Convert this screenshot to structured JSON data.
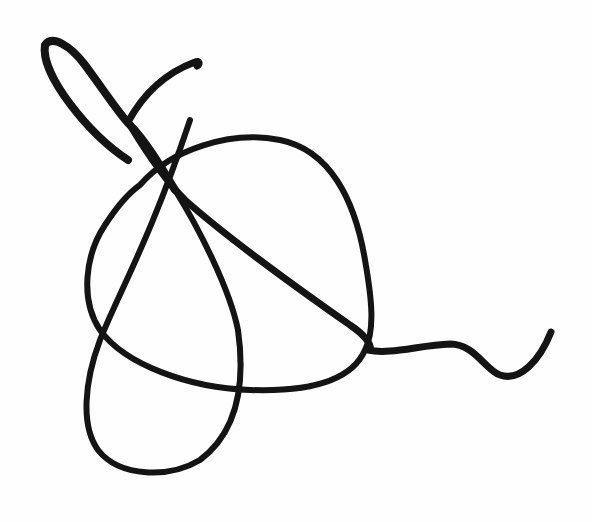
{
  "image": {
    "description": "Hand-drawn black ink scribble / signature-like line drawing on white paper",
    "background_color": "#fefefe",
    "ink_color": "#141414"
  },
  "strokes": [
    {
      "name": "top-left-loop",
      "d": "M 128 160 C 90 135, 40 75, 45 45 C 52 35, 70 45, 85 65 C 105 92, 120 115, 130 125 C 145 140, 160 165, 175 190"
    },
    {
      "name": "hook-top",
      "d": "M 128 122 C 140 100, 160 75, 195 62 C 200 60, 200 64, 197 66"
    },
    {
      "name": "main-diagonal",
      "d": "M 130 125 C 145 150, 165 180, 185 200 C 230 240, 300 290, 350 325 C 365 335, 372 345, 370 350"
    },
    {
      "name": "big-loop",
      "d": "M 140 185 C 170 150, 230 130, 280 140 C 330 150, 355 200, 365 260 C 372 300, 375 330, 365 350 C 352 380, 310 392, 250 390 C 190 388, 125 365, 100 330 C 80 300, 85 255, 105 225 C 118 205, 130 192, 140 185"
    },
    {
      "name": "inner-teardrop",
      "d": "M 175 190 C 200 230, 230 290, 238 330 C 245 380, 240 430, 200 460 C 170 478, 120 478, 98 450 C 80 425, 85 380, 100 340 C 120 290, 150 240, 190 120"
    },
    {
      "name": "tail-wave",
      "d": "M 368 350 C 390 355, 420 345, 450 344 C 475 344, 485 370, 500 375 C 520 382, 540 360, 551 332"
    }
  ]
}
